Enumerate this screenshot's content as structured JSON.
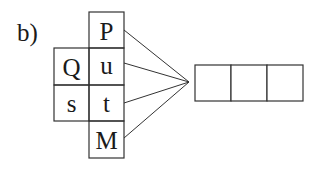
{
  "diagram": {
    "label": "b)",
    "grid": {
      "cells": [
        {
          "row": 0,
          "col": 1,
          "text": "P"
        },
        {
          "row": 1,
          "col": 0,
          "text": "Q"
        },
        {
          "row": 1,
          "col": 1,
          "text": "u"
        },
        {
          "row": 2,
          "col": 0,
          "text": "s"
        },
        {
          "row": 2,
          "col": 1,
          "text": "t"
        },
        {
          "row": 3,
          "col": 1,
          "text": "M"
        }
      ]
    },
    "connectors": {
      "from": [
        "P",
        "u",
        "t",
        "M"
      ],
      "converge_to": "answer-boxes"
    },
    "answer_boxes": {
      "count": 3,
      "values": [
        "",
        "",
        ""
      ]
    },
    "stroke_color": "#333333"
  }
}
